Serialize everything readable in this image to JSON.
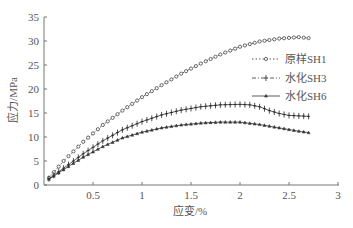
{
  "chart_data": {
    "type": "line",
    "title": "",
    "xlabel": "应变/%",
    "ylabel": "应力/MPa",
    "xlim": [
      0,
      3
    ],
    "ylim": [
      0,
      35
    ],
    "xticks": [
      "0.5",
      "1",
      "1.5",
      "2",
      "2.5",
      "3"
    ],
    "yticks": [
      "0",
      "5",
      "10",
      "15",
      "20",
      "25",
      "30",
      "35"
    ],
    "grid": false,
    "legend_position": "upper right",
    "series": [
      {
        "name": "原样SH1",
        "style": "dotted-circle",
        "x": [
          0.05,
          0.2,
          0.4,
          0.6,
          0.8,
          1.0,
          1.2,
          1.4,
          1.6,
          1.8,
          2.0,
          2.2,
          2.4,
          2.6,
          2.7
        ],
        "y": [
          1.5,
          5.0,
          9.0,
          12.5,
          15.5,
          18.3,
          20.8,
          23.2,
          25.3,
          27.2,
          28.8,
          29.9,
          30.5,
          30.8,
          30.6
        ]
      },
      {
        "name": "水化SH3",
        "style": "dashdot-plus",
        "x": [
          0.05,
          0.2,
          0.4,
          0.6,
          0.8,
          1.0,
          1.2,
          1.4,
          1.6,
          1.8,
          2.0,
          2.1,
          2.2,
          2.3,
          2.4,
          2.5,
          2.6,
          2.7
        ],
        "y": [
          1.3,
          3.5,
          6.5,
          9.2,
          11.5,
          13.2,
          14.6,
          15.6,
          16.3,
          16.7,
          16.8,
          16.7,
          16.3,
          15.5,
          14.9,
          14.5,
          14.4,
          14.3
        ]
      },
      {
        "name": "水化SH6",
        "style": "solid-triangle",
        "x": [
          0.05,
          0.2,
          0.4,
          0.6,
          0.8,
          1.0,
          1.2,
          1.4,
          1.6,
          1.8,
          2.0,
          2.2,
          2.4,
          2.6,
          2.7
        ],
        "y": [
          1.2,
          3.2,
          5.8,
          8.0,
          9.8,
          11.0,
          11.9,
          12.5,
          12.9,
          13.1,
          13.1,
          12.6,
          11.9,
          11.2,
          10.9
        ]
      }
    ]
  }
}
